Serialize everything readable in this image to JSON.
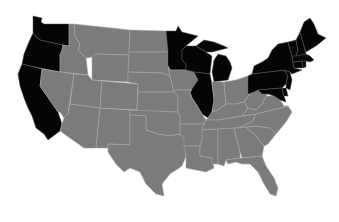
{
  "map": {
    "type": "choropleth",
    "region": "United States (contiguous)",
    "colors": {
      "highlighted": "#050505",
      "default": "#7b7b7b",
      "border": "#a8a8a8",
      "background": "#ffffff"
    },
    "highlighted_states": [
      "WA",
      "OR",
      "CA",
      "MN",
      "WI",
      "MI",
      "IL",
      "NY",
      "PA",
      "NJ",
      "DE",
      "MD",
      "CT",
      "RI",
      "MA",
      "VT",
      "NH",
      "ME"
    ],
    "default_states": [
      "ID",
      "MT",
      "WY",
      "NV",
      "UT",
      "CO",
      "AZ",
      "NM",
      "ND",
      "SD",
      "NE",
      "KS",
      "OK",
      "TX",
      "IA",
      "MO",
      "AR",
      "LA",
      "IN",
      "OH",
      "KY",
      "TN",
      "MS",
      "AL",
      "GA",
      "FL",
      "SC",
      "NC",
      "VA",
      "WV"
    ]
  }
}
